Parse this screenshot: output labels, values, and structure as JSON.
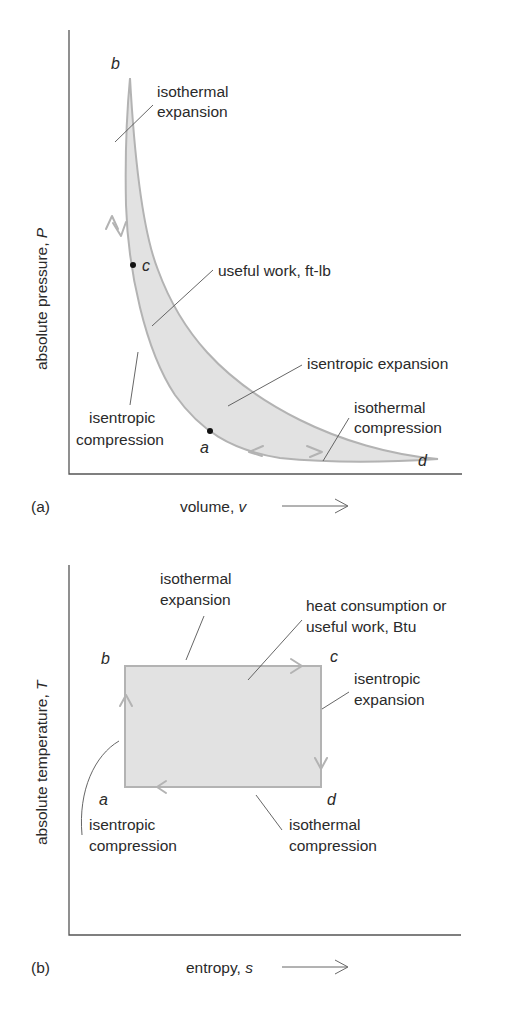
{
  "diagram_a": {
    "panel_label": "(a)",
    "x_axis_label": "volume, ",
    "x_axis_var": "v",
    "y_axis_label": "absolute pressure, ",
    "y_axis_var": "P",
    "points": {
      "a": "a",
      "b": "b",
      "c": "c",
      "d": "d"
    },
    "annotations": {
      "isothermal_expansion": [
        "isothermal",
        "expansion"
      ],
      "useful_work": "useful work, ft-lb",
      "isentropic_expansion": "isentropic expansion",
      "isothermal_compression": [
        "isothermal",
        "compression"
      ],
      "isentropic_compression": [
        "isentropic",
        "compression"
      ]
    }
  },
  "diagram_b": {
    "panel_label": "(b)",
    "x_axis_label": "entropy, ",
    "x_axis_var": "s",
    "y_axis_label": "absolute temperature, ",
    "y_axis_var": "T",
    "points": {
      "a": "a",
      "b": "b",
      "c": "c",
      "d": "d"
    },
    "annotations": {
      "isothermal_expansion": [
        "isothermal",
        "expansion"
      ],
      "heat_consumption": [
        "heat consumption or",
        "useful work, Btu"
      ],
      "isentropic_expansion": [
        "isentropic",
        "expansion"
      ],
      "isothermal_compression": [
        "isothermal",
        "compression"
      ],
      "isentropic_compression": [
        "isentropic",
        "compression"
      ]
    }
  },
  "colors": {
    "cycle_stroke": "#b3b3b3",
    "cycle_fill": "#e2e2e2",
    "axis": "#555555",
    "text": "#2a2a2a"
  }
}
